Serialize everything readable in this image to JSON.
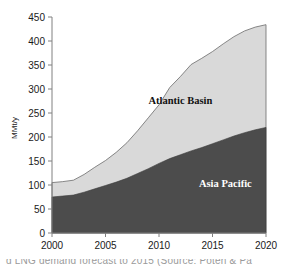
{
  "chart_data": {
    "type": "area",
    "title": "",
    "subtitle": "",
    "xlabel": "",
    "ylabel": "MMt/y",
    "xlim": [
      2000,
      2020
    ],
    "ylim": [
      0,
      450
    ],
    "grid": false,
    "stacked": true,
    "legend_position": "inline-annotations",
    "x": [
      2000,
      2001,
      2002,
      2003,
      2004,
      2005,
      2006,
      2007,
      2008,
      2009,
      2010,
      2011,
      2012,
      2013,
      2014,
      2015,
      2016,
      2017,
      2018,
      2019,
      2020
    ],
    "xticks": [
      2000,
      2005,
      2010,
      2015,
      2020
    ],
    "xtick_labels": [
      "2000",
      "2005",
      "2010",
      "2015",
      "2020"
    ],
    "yticks": [
      0,
      50,
      100,
      150,
      200,
      250,
      300,
      350,
      400,
      450
    ],
    "ytick_labels": [
      "0",
      "50",
      "100",
      "150",
      "200",
      "250",
      "300",
      "350",
      "400",
      "450"
    ],
    "series": [
      {
        "name": "Asia Pacific",
        "color": "#4a4a4a",
        "label_position": {
          "x": 2016.2,
          "y": 95
        },
        "values": [
          75,
          77,
          79,
          85,
          92,
          99,
          106,
          114,
          124,
          134,
          145,
          155,
          163,
          171,
          178,
          186,
          194,
          202,
          209,
          215,
          220
        ]
      },
      {
        "name": "Atlantic Basin",
        "color": "#d8d8d8",
        "label_position": {
          "x": 2012.0,
          "y": 268
        },
        "values": [
          30,
          30,
          31,
          37,
          45,
          52,
          62,
          74,
          89,
          106,
          122,
          148,
          163,
          180,
          186,
          192,
          200,
          207,
          212,
          214,
          214
        ]
      }
    ],
    "totals": [
      105,
      107,
      110,
      122,
      137,
      151,
      168,
      188,
      213,
      240,
      267,
      303,
      326,
      351,
      364,
      378,
      394,
      409,
      421,
      429,
      434
    ],
    "annotations": [
      {
        "text": "Atlantic Basin",
        "color": "#111111"
      },
      {
        "text": "Asia Pacific",
        "color": "#ffffff"
      }
    ]
  },
  "axes": {
    "y_axis_title": "MMt/y"
  },
  "caption": {
    "text": "d LNG demand forecast to 2015 (Source: Poten & Pa"
  }
}
